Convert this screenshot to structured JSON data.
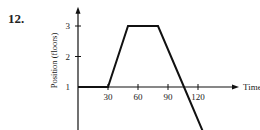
{
  "problem_number": "12.",
  "chart_data": {
    "type": "line",
    "title": "",
    "xlabel": "Time (s)",
    "ylabel": "Position (floors)",
    "x_ticks": [
      30,
      60,
      90,
      120
    ],
    "x_tick_labels": [
      "30",
      "60",
      "90",
      "120"
    ],
    "y_ticks": [
      -1,
      1,
      2,
      3
    ],
    "y_tick_labels": [
      "B",
      "1",
      "2",
      "3"
    ],
    "xlim": [
      0,
      130
    ],
    "ylim": [
      -1.2,
      3.6
    ],
    "grid": false,
    "series": [
      {
        "name": "position",
        "x": [
          0,
          30,
          50,
          80,
          106,
          128
        ],
        "y": [
          1,
          1,
          3,
          3,
          1,
          -0.7
        ]
      }
    ]
  }
}
